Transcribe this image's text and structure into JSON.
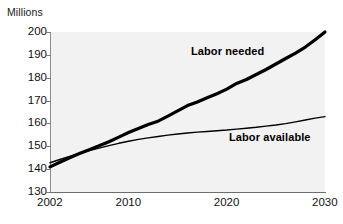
{
  "chart_data": {
    "type": "line",
    "title": "",
    "subtitle": "",
    "xlabel": "",
    "ylabel": "Millions",
    "ylim": [
      130,
      200
    ],
    "xlim": [
      2002,
      2030
    ],
    "grid": false,
    "legend_position": "inline-annotations",
    "yticks": [
      130,
      140,
      150,
      160,
      170,
      180,
      190,
      200
    ],
    "ytick_labels": [
      "130",
      "140",
      "150",
      "160",
      "170",
      "180",
      "190",
      "200"
    ],
    "xticks": [
      2002,
      2010,
      2020,
      2030
    ],
    "xtick_labels": [
      "2002",
      "2010",
      "2020",
      "2030"
    ],
    "x": [
      2002,
      2003,
      2004,
      2005,
      2006,
      2007,
      2008,
      2009,
      2010,
      2011,
      2012,
      2013,
      2014,
      2015,
      2016,
      2017,
      2018,
      2019,
      2020,
      2021,
      2022,
      2023,
      2024,
      2025,
      2026,
      2027,
      2028,
      2029,
      2030
    ],
    "series": [
      {
        "name": "Labor needed",
        "style": "thick",
        "color": "#000000",
        "values": [
          141.0,
          143.0,
          145.0,
          146.8,
          148.5,
          150.2,
          152.0,
          154.0,
          156.0,
          157.8,
          159.5,
          161.0,
          163.2,
          165.5,
          167.8,
          169.4,
          171.2,
          173.0,
          175.0,
          177.5,
          179.2,
          181.4,
          183.6,
          186.0,
          188.4,
          190.8,
          193.4,
          196.6,
          200.0
        ]
      },
      {
        "name": "Labor available",
        "style": "thin",
        "color": "#000000",
        "values": [
          142.8,
          144.2,
          145.6,
          146.9,
          148.1,
          149.2,
          150.3,
          151.3,
          152.2,
          153.0,
          153.7,
          154.3,
          154.9,
          155.4,
          155.8,
          156.2,
          156.5,
          156.8,
          157.1,
          157.5,
          157.9,
          158.3,
          158.8,
          159.3,
          159.9,
          160.7,
          161.5,
          162.3,
          163.0
        ]
      }
    ],
    "annotations": [
      {
        "text": "Labor needed",
        "series": "Labor needed"
      },
      {
        "text": "Labor available",
        "series": "Labor available"
      }
    ]
  },
  "colors": {
    "plot_background": "#f2f2f2",
    "page_background": "#ffffff",
    "axis": "#7a7a7a",
    "line": "#000000",
    "text": "#111111"
  }
}
